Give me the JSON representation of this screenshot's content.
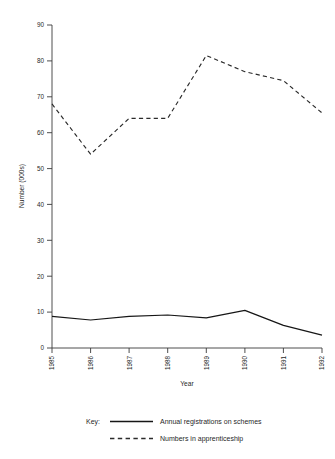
{
  "chart_data": {
    "type": "line",
    "title": "",
    "xlabel": "Year",
    "ylabel": "Number (000s)",
    "categories": [
      "1985",
      "1986",
      "1987",
      "1988",
      "1989",
      "1990",
      "1991",
      "1992"
    ],
    "x": [
      1985,
      1986,
      1987,
      1988,
      1989,
      1990,
      1991,
      1992
    ],
    "ylim": [
      0,
      90
    ],
    "yticks": [
      0,
      10,
      20,
      30,
      40,
      50,
      60,
      70,
      80,
      90
    ],
    "grid": false,
    "legend_position": "bottom",
    "legend_prefix": "Key:",
    "series": [
      {
        "name": "Annual registrations on schemes",
        "style": "solid",
        "values": [
          8.8,
          7.8,
          8.8,
          9.2,
          8.4,
          10.5,
          6.3,
          3.6
        ]
      },
      {
        "name": "Numbers in apprenticeship",
        "style": "dashed",
        "values": [
          68.0,
          54.0,
          64.0,
          64.0,
          81.5,
          77.0,
          74.5,
          65.5
        ]
      }
    ]
  },
  "ytick_labels": [
    "0",
    "10",
    "20",
    "30",
    "40",
    "50",
    "60",
    "70",
    "80",
    "90"
  ],
  "xtick_labels": [
    "1985",
    "1986",
    "1987",
    "1988",
    "1989",
    "1990",
    "1991",
    "1992"
  ],
  "axis": {
    "y_title": "Number (000s)",
    "x_title": "Year"
  },
  "legend": {
    "prefix": "Key:",
    "entries": [
      {
        "label": "Annual registrations on schemes",
        "style": "solid"
      },
      {
        "label": "Numbers in apprenticeship",
        "style": "dashed"
      }
    ]
  }
}
